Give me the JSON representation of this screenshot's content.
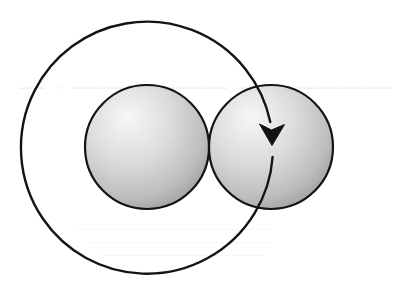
{
  "diagram": {
    "title": "Rotation of a sphere around an adjacent sphere",
    "canvas": {
      "width": 353,
      "height": 291,
      "background": "#ffffff"
    },
    "elements": {
      "sphere_left": {
        "label": "sphere",
        "cx": 147,
        "cy": 147,
        "r": 62
      },
      "sphere_right": {
        "label": "sphere",
        "cx": 271,
        "cy": 147,
        "r": 62
      },
      "orbit_arrow": {
        "label": "circular arrow",
        "direction": "clockwise",
        "cx": 147,
        "cy": 148,
        "r": 126,
        "arrowhead_tip": {
          "x": 272,
          "y": 145
        }
      }
    },
    "colors": {
      "stroke": "#141414",
      "sphere_highlight": "#f7f7f7",
      "sphere_mid": "#d6d6d6",
      "sphere_shadow": "#9e9e9e",
      "bleed_through_text": "#f1f1f1"
    }
  }
}
